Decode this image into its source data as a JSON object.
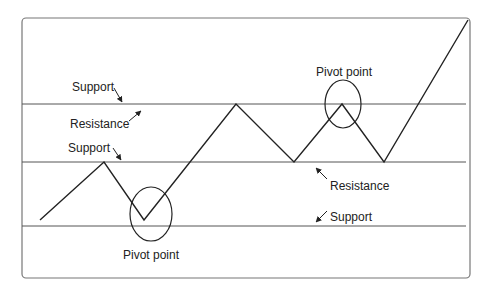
{
  "diagram": {
    "colors": {
      "line": "#222222",
      "guide": "#555555",
      "border": "#777777",
      "text": "#222222"
    },
    "horizontal_lines": [
      {
        "name": "upper-level",
        "y": 104
      },
      {
        "name": "middle-level",
        "y": 162
      },
      {
        "name": "lower-level",
        "y": 226
      }
    ],
    "price_path": [
      [
        40,
        220
      ],
      [
        104,
        162
      ],
      [
        144,
        220
      ],
      [
        236,
        104
      ],
      [
        294,
        162
      ],
      [
        342,
        104
      ],
      [
        384,
        162
      ],
      [
        468,
        20
      ]
    ],
    "circles": [
      {
        "name": "pivot-circle-low",
        "cx": 151,
        "cy": 214,
        "rx": 21,
        "ry": 27
      },
      {
        "name": "pivot-circle-high",
        "cx": 343,
        "cy": 104,
        "rx": 18,
        "ry": 24
      }
    ],
    "labels": {
      "support_upper": "Support",
      "resistance_upper": "Resistance",
      "support_middle": "Support",
      "pivot_top": "Pivot point",
      "resistance_lower": "Resistance",
      "support_lower": "Support",
      "pivot_bottom": "Pivot point"
    }
  }
}
